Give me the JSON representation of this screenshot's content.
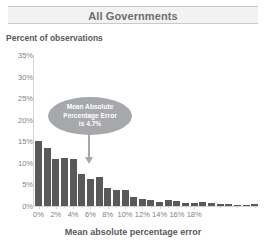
{
  "header": {
    "title": "All Governments"
  },
  "chart_data": {
    "type": "bar",
    "title": "All Governments",
    "ylabel": "Percent of observations",
    "xlabel": "Mean absolute percentage error",
    "ylim": [
      0,
      35
    ],
    "ytick_labels": [
      "0%",
      "5%",
      "10%",
      "15%",
      "20%",
      "25%",
      "30%",
      "35%"
    ],
    "ytick_values": [
      0,
      5,
      10,
      15,
      20,
      25,
      30,
      35
    ],
    "xtick_labels": [
      "0%",
      "2%",
      "4%",
      "6%",
      "8%",
      "10%",
      "12%",
      "14%",
      "16%",
      "18%"
    ],
    "xtick_values": [
      0,
      2,
      4,
      6,
      8,
      10,
      12,
      14,
      16,
      18
    ],
    "xlim": [
      -0.5,
      20.5
    ],
    "grid": false,
    "legend": "none",
    "bar_color": "#595959",
    "categories": [
      0,
      0.8,
      1.6,
      2.4,
      3.2,
      4.0,
      4.8,
      5.6,
      6.4,
      7.2,
      8.0,
      8.8,
      9.6,
      10.4,
      11.2,
      12.0,
      12.8,
      13.6,
      14.4,
      15.2,
      16.0,
      16.8,
      17.6,
      18.4,
      19.2,
      20.0
    ],
    "values": [
      15.0,
      13.5,
      11.0,
      11.2,
      10.8,
      7.5,
      6.3,
      6.8,
      4.2,
      3.8,
      3.6,
      2.2,
      1.6,
      1.5,
      1.0,
      1.3,
      1.2,
      0.7,
      0.8,
      0.9,
      0.6,
      0.5,
      0.4,
      0.3,
      0.2,
      0.4
    ],
    "annotations": [
      {
        "name": "mean-absolute-percentage-error-callout",
        "lines": [
          "Mean Absolute",
          "Percentage Error",
          "is 4.7%"
        ],
        "text": "Mean Absolute Percentage Error is 4.7%",
        "points_to_value": 4.7,
        "shape": "ellipse",
        "fill": "#a6a8ab",
        "text_color": "#ffffff"
      }
    ]
  },
  "callout": {
    "line1": "Mean Absolute",
    "line2": "Percentage Error",
    "line3": "is 4.7%"
  }
}
